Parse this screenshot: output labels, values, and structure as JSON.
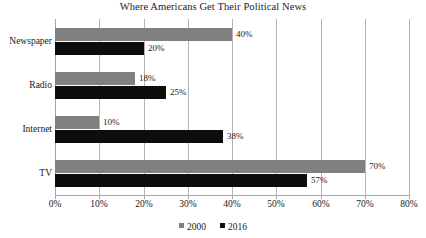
{
  "chart_data": {
    "type": "bar",
    "orientation": "horizontal",
    "title": "Where Americans Get Their Political News",
    "xlabel": "",
    "ylabel": "",
    "xlim": [
      0,
      80
    ],
    "xticks": [
      "0%",
      "10%",
      "20%",
      "30%",
      "40%",
      "50%",
      "60%",
      "70%",
      "80%"
    ],
    "xtick_values": [
      0,
      10,
      20,
      30,
      40,
      50,
      60,
      70,
      80
    ],
    "grid": true,
    "legend_position": "bottom",
    "categories": [
      "Newspaper",
      "Radio",
      "Internet",
      "TV"
    ],
    "series": [
      {
        "name": "2000",
        "color": "#808080",
        "values": [
          40,
          18,
          10,
          70
        ],
        "labels": [
          "40%",
          "18%",
          "10%",
          "70%"
        ]
      },
      {
        "name": "2016",
        "color": "#0d0d0d",
        "values": [
          20,
          25,
          38,
          57
        ],
        "labels": [
          "20%",
          "25%",
          "38%",
          "57%"
        ]
      }
    ]
  },
  "colors": {
    "series_2000": "#808080",
    "series_2016": "#0d0d0d",
    "gridline": "#b4b4b4",
    "axis": "#a6a6a6",
    "text": "#1a1a1a",
    "background": "#ffffff"
  }
}
